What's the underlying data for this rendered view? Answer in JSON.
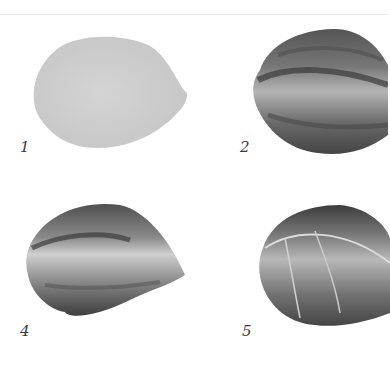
{
  "figure": {
    "panels": [
      {
        "label": "1",
        "stage": "flat light gray base wash"
      },
      {
        "label": "2",
        "stage": "dark strokes added along upper and lower edges"
      },
      {
        "label": "4",
        "stage": "blended feathered strokes with light center"
      },
      {
        "label": "5",
        "stage": "finished petal with light vein lines"
      }
    ]
  },
  "colors": {
    "background": "#ffffff",
    "base_wash": "#cfcfcf",
    "dark_stroke": "#3c3c3c",
    "mid_tone": "#8a8a8a",
    "highlight": "#e2e2e2"
  }
}
